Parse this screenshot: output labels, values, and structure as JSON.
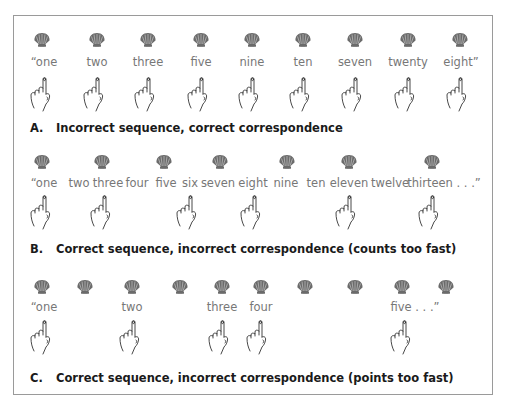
{
  "colors": {
    "shell": "#6b6b6b",
    "word": "#777777",
    "caption": "#1a1a1a",
    "frame": "#9a9a9a",
    "hand_stroke": "#333333"
  },
  "panels": [
    {
      "id": "A",
      "letter": "A.",
      "caption": "Incorrect sequence, correct correspondence",
      "shells_x": [
        42,
        97,
        148,
        201,
        252,
        303,
        355,
        408,
        460
      ],
      "words": [
        {
          "text": "“one",
          "x": 44
        },
        {
          "text": "two",
          "x": 97
        },
        {
          "text": "three",
          "x": 148
        },
        {
          "text": "five",
          "x": 201
        },
        {
          "text": "nine",
          "x": 252
        },
        {
          "text": "ten",
          "x": 303
        },
        {
          "text": "seven",
          "x": 355
        },
        {
          "text": "twenty",
          "x": 408
        },
        {
          "text": "eight”",
          "x": 461
        }
      ],
      "hands_x": [
        44,
        97,
        148,
        201,
        252,
        303,
        355,
        408,
        460
      ]
    },
    {
      "id": "B",
      "letter": "B.",
      "caption": "Correct sequence, incorrect correspondence (counts too fast)",
      "shells_x": [
        42,
        102,
        164,
        220,
        287,
        349,
        432
      ],
      "words": [
        {
          "text": "“one",
          "x": 44
        },
        {
          "text": "two",
          "x": 79
        },
        {
          "text": "three",
          "x": 108
        },
        {
          "text": "four",
          "x": 137
        },
        {
          "text": "five",
          "x": 166
        },
        {
          "text": "six",
          "x": 190
        },
        {
          "text": "seven",
          "x": 218
        },
        {
          "text": "eight",
          "x": 253
        },
        {
          "text": "nine",
          "x": 286
        },
        {
          "text": "ten",
          "x": 316
        },
        {
          "text": "eleven",
          "x": 349
        },
        {
          "text": "twelve",
          "x": 390
        },
        {
          "text": "thirteen . . .”",
          "x": 444
        }
      ],
      "hands_x": [
        44,
        104,
        190,
        254,
        349,
        432
      ]
    },
    {
      "id": "C",
      "letter": "C.",
      "caption": "Correct sequence, incorrect correspondence (points too fast)",
      "shells_x": [
        42,
        85,
        132,
        180,
        222,
        261,
        305,
        355,
        402,
        446
      ],
      "words": [
        {
          "text": "“one",
          "x": 44
        },
        {
          "text": "two",
          "x": 132
        },
        {
          "text": "three",
          "x": 222
        },
        {
          "text": "four",
          "x": 261
        },
        {
          "text": "five . . .”",
          "x": 415
        }
      ],
      "hands_x": [
        44,
        133,
        222,
        260,
        404
      ]
    }
  ],
  "layout": {
    "A": {
      "shell_y": 32,
      "word_y": 55,
      "hand_y": 76,
      "caption_y": 121
    },
    "B": {
      "shell_y": 154,
      "word_y": 176,
      "hand_y": 194,
      "caption_y": 242
    },
    "C": {
      "shell_y": 279,
      "word_y": 300,
      "hand_y": 319,
      "caption_y": 371
    }
  }
}
